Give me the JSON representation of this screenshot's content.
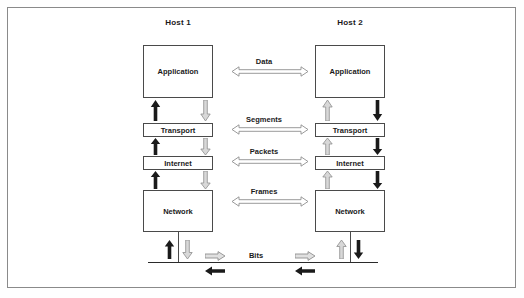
{
  "diagram": {
    "type": "network-layer-diagram",
    "border_color": "#8a8a8a",
    "box_border_color": "#4a4a4a",
    "solid_arrow_color": "#1a1a1a",
    "hollow_arrow_color": "#9a9a9a",
    "background": "#ffffff"
  },
  "hosts": [
    {
      "id": "host1",
      "title": "Host 1",
      "layers": [
        {
          "name": "Application",
          "size": "large"
        },
        {
          "name": "Transport",
          "size": "small"
        },
        {
          "name": "Internet",
          "size": "small"
        },
        {
          "name": "Network",
          "size": "large"
        }
      ],
      "up_arrow_style": "solid",
      "down_arrow_style": "hollow"
    },
    {
      "id": "host2",
      "title": "Host 2",
      "layers": [
        {
          "name": "Application",
          "size": "large"
        },
        {
          "name": "Transport",
          "size": "small"
        },
        {
          "name": "Internet",
          "size": "small"
        },
        {
          "name": "Network",
          "size": "large"
        }
      ],
      "up_arrow_style": "hollow",
      "down_arrow_style": "solid"
    }
  ],
  "peer_exchanges": [
    {
      "label": "Data",
      "between": "Application",
      "arrow": "double-hollow"
    },
    {
      "label": "Segments",
      "between": "Transport",
      "arrow": "double-hollow"
    },
    {
      "label": "Packets",
      "between": "Internet",
      "arrow": "double-hollow"
    },
    {
      "label": "Frames",
      "between": "Network",
      "arrow": "double-hollow"
    }
  ],
  "medium": {
    "label": "Bits",
    "forward_arrow_style": "hollow-right",
    "return_arrow_style": "solid-left",
    "forward_arrow_count": 2,
    "return_arrow_count": 2
  }
}
